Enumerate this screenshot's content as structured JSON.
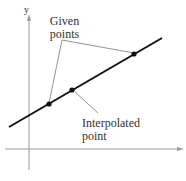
{
  "axes": {
    "y_label": "y",
    "x_label": ""
  },
  "labels": {
    "given_line1": "Given",
    "given_line2": "points",
    "interp_line1": "Interpolated",
    "interp_line2": "point"
  },
  "colors": {
    "line": "#111111",
    "axis": "#999999",
    "leader": "#777777",
    "text": "#333333"
  }
}
